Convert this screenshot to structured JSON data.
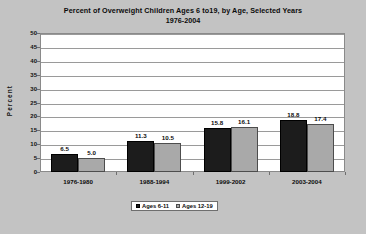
{
  "chart_data": {
    "type": "bar",
    "title": "Percent of Overweight Children Ages 6 to19, by Age, Selected Years",
    "subtitle": "1976-2004",
    "xlabel": "",
    "ylabel": "Percent",
    "categories": [
      "1976-1980",
      "1988-1994",
      "1999-2002",
      "2003-2004"
    ],
    "series": [
      {
        "name": "Ages 6-11",
        "values": [
          6.5,
          11.3,
          15.8,
          18.8
        ],
        "color": "#1c1c1c"
      },
      {
        "name": "Ages 12-19",
        "values": [
          5.0,
          10.5,
          16.1,
          17.4
        ],
        "color": "#a9a9a9"
      }
    ],
    "value_labels": [
      [
        "6.5",
        "5.0"
      ],
      [
        "11.3",
        "10.5"
      ],
      [
        "15.8",
        "16.1"
      ],
      [
        "18.8",
        "17.4"
      ]
    ],
    "ylim": [
      0,
      50
    ],
    "ytick_step": 5,
    "yticks": [
      "50",
      "45",
      "40",
      "35",
      "30",
      "25",
      "20",
      "15",
      "10",
      "5",
      "0"
    ],
    "grid": true,
    "legend_position": "bottom",
    "plot_background": "#ffffff",
    "page_background": "#c3c3c3"
  }
}
